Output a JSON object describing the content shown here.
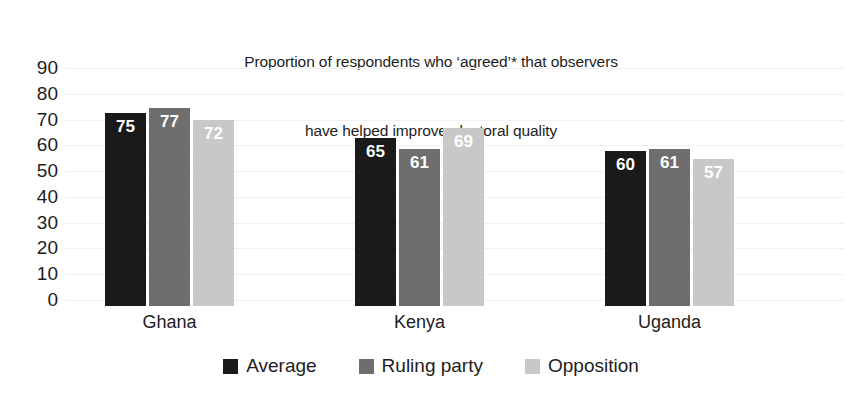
{
  "chart_data": {
    "type": "bar",
    "title": "Proportion of respondents who ‘agreed’* that observers\nhave helped improve electoral quality",
    "title_line1": "Proportion of respondents who ‘agreed’* that observers",
    "title_line2": "have helped improve electoral quality",
    "xlabel": "",
    "ylabel": "",
    "ylim": [
      0,
      90
    ],
    "ytick_step": 10,
    "yticks": [
      "90",
      "80",
      "70",
      "60",
      "50",
      "40",
      "30",
      "20",
      "10",
      "0"
    ],
    "grid": true,
    "legend_position": "bottom",
    "categories": [
      "Ghana",
      "Kenya",
      "Uganda"
    ],
    "series": [
      {
        "name": "Average",
        "color": "#1a1a1a",
        "values": [
          75,
          77,
          72
        ]
      },
      {
        "name": "Ruling party",
        "color": "#6e6e6e",
        "values": [
          65,
          61,
          69
        ]
      },
      {
        "name": "Opposition",
        "color": "#c8c8c8",
        "values": [
          60,
          61,
          57
        ]
      }
    ],
    "groups": [
      {
        "category": "Ghana",
        "bars": [
          {
            "series": "Average",
            "value": 75,
            "label": "75",
            "color": "#1a1a1a"
          },
          {
            "series": "Ruling party",
            "value": 77,
            "label": "77",
            "color": "#6e6e6e"
          },
          {
            "series": "Opposition",
            "value": 72,
            "label": "72",
            "color": "#c8c8c8"
          }
        ]
      },
      {
        "category": "Kenya",
        "bars": [
          {
            "series": "Average",
            "value": 65,
            "label": "65",
            "color": "#1a1a1a"
          },
          {
            "series": "Ruling party",
            "value": 61,
            "label": "61",
            "color": "#6e6e6e"
          },
          {
            "series": "Opposition",
            "value": 69,
            "label": "69",
            "color": "#c8c8c8"
          }
        ]
      },
      {
        "category": "Uganda",
        "bars": [
          {
            "series": "Average",
            "value": 60,
            "label": "60",
            "color": "#1a1a1a"
          },
          {
            "series": "Ruling party",
            "value": 61,
            "label": "61",
            "color": "#6e6e6e"
          },
          {
            "series": "Opposition",
            "value": 57,
            "label": "57",
            "color": "#c8c8c8"
          }
        ]
      }
    ]
  }
}
